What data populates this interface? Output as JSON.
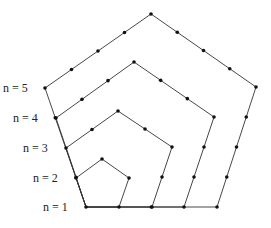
{
  "diagram": {
    "type": "pentagonal-numbers",
    "line_color": "#333333",
    "dot_color": "#111111",
    "labels": [
      {
        "text": "n = 5",
        "x": 3,
        "y": 82
      },
      {
        "text": "n = 4",
        "x": 13,
        "y": 112
      },
      {
        "text": "n = 3",
        "x": 23,
        "y": 142
      },
      {
        "text": "n = 2",
        "x": 33,
        "y": 172
      },
      {
        "text": "n = 1",
        "x": 43,
        "y": 201
      }
    ],
    "pentagons": [
      {
        "n": 2,
        "vertices": [
          [
            86,
            207
          ],
          [
            119,
            207
          ],
          [
            129,
            178
          ],
          [
            102,
            159
          ],
          [
            76,
            178
          ]
        ]
      },
      {
        "n": 3,
        "vertices": [
          [
            86,
            207
          ],
          [
            152,
            207
          ],
          [
            172,
            147
          ],
          [
            118,
            111
          ],
          [
            66,
            148
          ]
        ]
      },
      {
        "n": 4,
        "vertices": [
          [
            86,
            207
          ],
          [
            184,
            207
          ],
          [
            214,
            117
          ],
          [
            134,
            62
          ],
          [
            56,
            118
          ]
        ]
      },
      {
        "n": 5,
        "vertices": [
          [
            86,
            207
          ],
          [
            217,
            207
          ],
          [
            256,
            87
          ],
          [
            151,
            14
          ],
          [
            45,
            88
          ]
        ]
      }
    ]
  }
}
